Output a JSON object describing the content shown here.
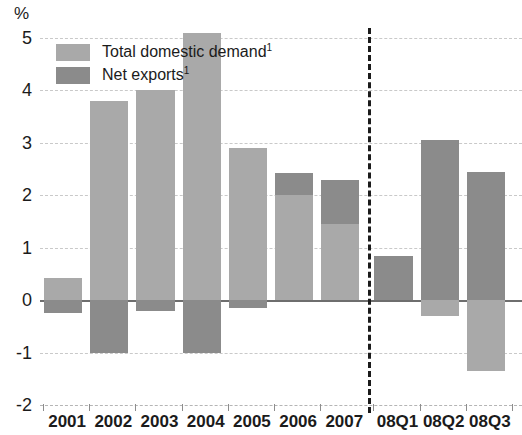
{
  "chart_data": {
    "type": "bar",
    "title": "",
    "subtitle": "",
    "xlabel": "",
    "ylabel": "%",
    "unit": "%",
    "ylim": [
      -2,
      5
    ],
    "yticks": [
      5,
      4,
      3,
      2,
      1,
      0,
      -1,
      -2
    ],
    "ytick_labels": [
      "5",
      "4",
      "3",
      "2",
      "1",
      "0",
      "-1",
      "-2"
    ],
    "grid": true,
    "stacked": true,
    "legend_position": "top-left",
    "categories": [
      "2001",
      "2002",
      "2003",
      "2004",
      "2005",
      "2006",
      "2007",
      "08Q1",
      "08Q2",
      "08Q3"
    ],
    "series": [
      {
        "name": "Total domestic demand¹",
        "color": "#a9a9a9",
        "values": [
          0.42,
          3.8,
          4.0,
          5.1,
          2.9,
          2.0,
          1.45,
          0.0,
          -0.3,
          -1.35
        ]
      },
      {
        "name": "Net exports¹",
        "color": "#8b8b8b",
        "values": [
          -0.25,
          -1.0,
          -0.2,
          -1.0,
          -0.15,
          0.43,
          0.85,
          0.85,
          3.05,
          2.45
        ]
      }
    ],
    "totals": [
      0.42,
      2.8,
      3.8,
      4.1,
      2.75,
      2.43,
      2.3,
      0.85,
      2.75,
      1.1
    ],
    "annotations": {
      "forecast_divider": {
        "after_category": "2007",
        "style": "dashed-vertical"
      }
    }
  },
  "legend": {
    "items": [
      {
        "label": "Total domestic demand",
        "superscript": "1",
        "color": "#a9a9a9",
        "name": "total-domestic-demand"
      },
      {
        "label": "Net exports",
        "superscript": "1",
        "color": "#8b8b8b",
        "name": "net-exports"
      }
    ]
  },
  "colors": {
    "light": "#a9a9a9",
    "dark": "#8b8b8b",
    "grid": "#c9c9c9",
    "axis": "#6e6e6e",
    "text": "#1b1b1b"
  }
}
